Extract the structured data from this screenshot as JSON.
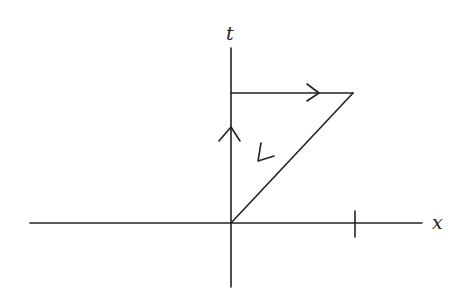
{
  "diagram": {
    "type": "spacetime-path",
    "axes": {
      "horizontal_label": "x",
      "vertical_label": "t"
    },
    "path": [
      {
        "segment": "up-along-t-axis",
        "direction": "up"
      },
      {
        "segment": "horizontal-right",
        "direction": "right"
      },
      {
        "segment": "diagonal-back-to-origin",
        "direction": "down-left"
      }
    ],
    "tick_marks": [
      "x-axis-tick"
    ],
    "colors": {
      "stroke": "#222222",
      "background": "#ffffff"
    }
  }
}
